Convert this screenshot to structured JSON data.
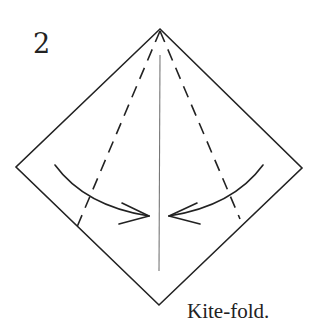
{
  "diagram": {
    "step_number": "2",
    "caption": "Kite-fold.",
    "colors": {
      "line": "#222222",
      "center_crease": "#777777",
      "background": "#ffffff"
    },
    "shape": "square rotated as diamond",
    "vertices": {
      "top": [
        160,
        29
      ],
      "left": [
        16,
        167
      ],
      "right": [
        302,
        168
      ],
      "bottom": [
        159,
        305
      ]
    },
    "valley_fold_lines": [
      {
        "name": "left-valley-fold",
        "from": [
          160,
          29
        ],
        "to": [
          77,
          227
        ],
        "style": "dashed"
      },
      {
        "name": "right-valley-fold",
        "from": [
          160,
          29
        ],
        "to": [
          240,
          219
        ],
        "style": "dashed"
      }
    ],
    "center_crease": {
      "from": [
        160,
        55
      ],
      "to": [
        159,
        271
      ]
    },
    "arrows": [
      {
        "name": "left-fold-arrow",
        "direction": "fold edge to center",
        "from": [
          55,
          165
        ],
        "to": [
          149,
          216
        ]
      },
      {
        "name": "right-fold-arrow",
        "direction": "fold edge to center",
        "from": [
          263,
          165
        ],
        "to": [
          169,
          216
        ]
      }
    ]
  }
}
